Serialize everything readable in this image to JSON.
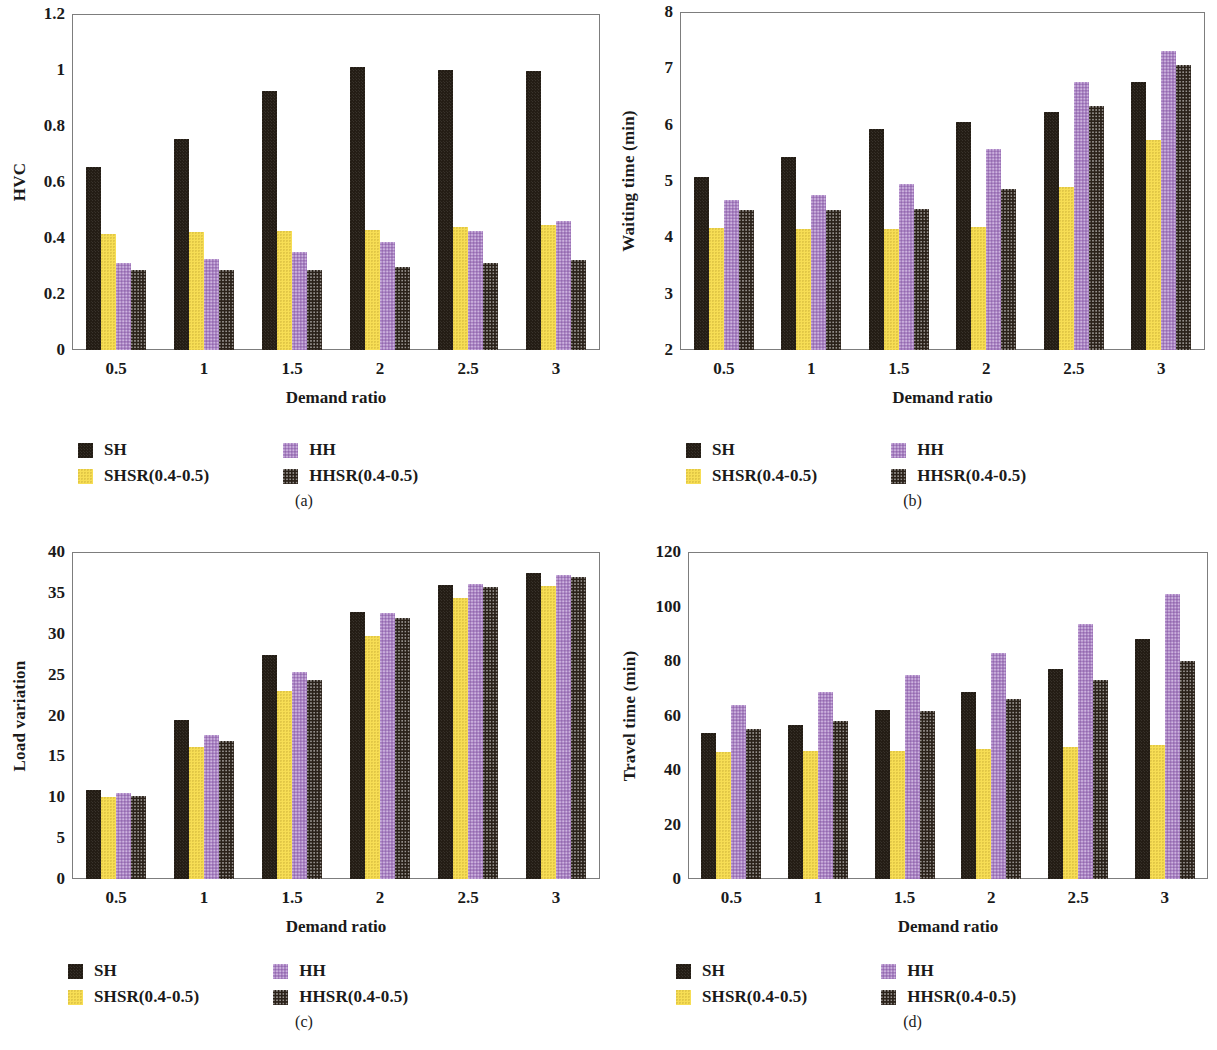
{
  "figure": {
    "series_colors": {
      "SH": "#231c14",
      "SHSR(0.4-0.5)": "#f7de55",
      "HH": "#a981c4",
      "HHSR(0.4-0.5)": "#2a2119"
    },
    "legend": {
      "items": [
        {
          "label": "SH",
          "swatch": "sh-swatch"
        },
        {
          "label": "HH",
          "swatch": "hh-swatch"
        },
        {
          "label": "SHSR(0.4-0.5)",
          "swatch": "shsr-swatch"
        },
        {
          "label": "HHSR(0.4-0.5)",
          "swatch": "hhsr-swatch"
        }
      ]
    },
    "captions": {
      "a": "(a)",
      "b": "(b)",
      "c": "(c)",
      "d": "(d)"
    }
  },
  "chart_data": [
    {
      "type": "bar",
      "panel": "a",
      "title": "",
      "xlabel": "Demand ratio",
      "ylabel": "HVC",
      "categories": [
        "0.5",
        "1",
        "1.5",
        "2",
        "2.5",
        "3"
      ],
      "ylim": [
        0,
        1.2
      ],
      "yticks": [
        "0",
        "0.2",
        "0.4",
        "0.6",
        "0.8",
        "1",
        "1.2"
      ],
      "ytick_values": [
        0,
        0.2,
        0.4,
        0.6,
        0.8,
        1.0,
        1.2
      ],
      "grid": false,
      "legend_position": "below",
      "series": [
        {
          "name": "SH",
          "values": [
            0.655,
            0.755,
            0.925,
            1.01,
            1.0,
            0.995
          ]
        },
        {
          "name": "SHSR(0.4-0.5)",
          "values": [
            0.415,
            0.42,
            0.425,
            0.43,
            0.44,
            0.445
          ]
        },
        {
          "name": "HH",
          "values": [
            0.31,
            0.325,
            0.35,
            0.385,
            0.425,
            0.46
          ]
        },
        {
          "name": "HHSR(0.4-0.5)",
          "values": [
            0.285,
            0.285,
            0.285,
            0.295,
            0.31,
            0.32
          ]
        }
      ]
    },
    {
      "type": "bar",
      "panel": "b",
      "title": "",
      "xlabel": "Demand ratio",
      "ylabel": "Waiting time (min)",
      "categories": [
        "0.5",
        "1",
        "1.5",
        "2",
        "2.5",
        "3"
      ],
      "ylim": [
        2,
        8
      ],
      "yticks": [
        "2",
        "3",
        "4",
        "5",
        "6",
        "7",
        "8"
      ],
      "ytick_values": [
        2,
        3,
        4,
        5,
        6,
        7,
        8
      ],
      "grid": false,
      "legend_position": "below",
      "series": [
        {
          "name": "SH",
          "values": [
            5.08,
            5.42,
            5.92,
            6.05,
            6.23,
            6.75
          ]
        },
        {
          "name": "SHSR(0.4-0.5)",
          "values": [
            4.16,
            4.15,
            4.14,
            4.18,
            4.89,
            5.72
          ]
        },
        {
          "name": "HH",
          "values": [
            4.67,
            4.75,
            4.95,
            5.57,
            6.76,
            7.3
          ]
        },
        {
          "name": "HHSR(0.4-0.5)",
          "values": [
            4.48,
            4.49,
            4.5,
            4.85,
            6.34,
            7.06
          ]
        }
      ]
    },
    {
      "type": "bar",
      "panel": "c",
      "title": "",
      "xlabel": "Demand ratio",
      "ylabel": "Load variation",
      "categories": [
        "0.5",
        "1",
        "1.5",
        "2",
        "2.5",
        "3"
      ],
      "ylim": [
        0,
        40
      ],
      "yticks": [
        "0",
        "5",
        "10",
        "15",
        "20",
        "25",
        "30",
        "35",
        "40"
      ],
      "ytick_values": [
        0,
        5,
        10,
        15,
        20,
        25,
        30,
        35,
        40
      ],
      "grid": false,
      "legend_position": "below",
      "series": [
        {
          "name": "SH",
          "values": [
            10.9,
            19.4,
            27.4,
            32.7,
            36.0,
            37.4
          ]
        },
        {
          "name": "SHSR(0.4-0.5)",
          "values": [
            10.0,
            16.1,
            23.0,
            29.7,
            34.4,
            35.8
          ]
        },
        {
          "name": "HH",
          "values": [
            10.5,
            17.6,
            25.3,
            32.5,
            36.1,
            37.2
          ]
        },
        {
          "name": "HHSR(0.4-0.5)",
          "values": [
            10.2,
            16.9,
            24.4,
            31.9,
            35.7,
            36.9
          ]
        }
      ]
    },
    {
      "type": "bar",
      "panel": "d",
      "title": "",
      "xlabel": "Demand ratio",
      "ylabel": "Travel time (min)",
      "categories": [
        "0.5",
        "1",
        "1.5",
        "2",
        "2.5",
        "3"
      ],
      "ylim": [
        0,
        120
      ],
      "yticks": [
        "0",
        "20",
        "40",
        "60",
        "80",
        "100",
        "120"
      ],
      "ytick_values": [
        0,
        20,
        40,
        60,
        80,
        100,
        120
      ],
      "grid": false,
      "legend_position": "below",
      "series": [
        {
          "name": "SH",
          "values": [
            53.5,
            56.5,
            62.0,
            68.5,
            77.0,
            88.0
          ]
        },
        {
          "name": "SHSR(0.4-0.5)",
          "values": [
            46.5,
            46.8,
            47.0,
            47.8,
            48.5,
            49.0
          ]
        },
        {
          "name": "HH",
          "values": [
            64.0,
            68.5,
            75.0,
            83.0,
            93.5,
            104.5
          ]
        },
        {
          "name": "HHSR(0.4-0.5)",
          "values": [
            55.0,
            58.0,
            61.5,
            66.0,
            73.0,
            80.0
          ]
        }
      ]
    }
  ]
}
